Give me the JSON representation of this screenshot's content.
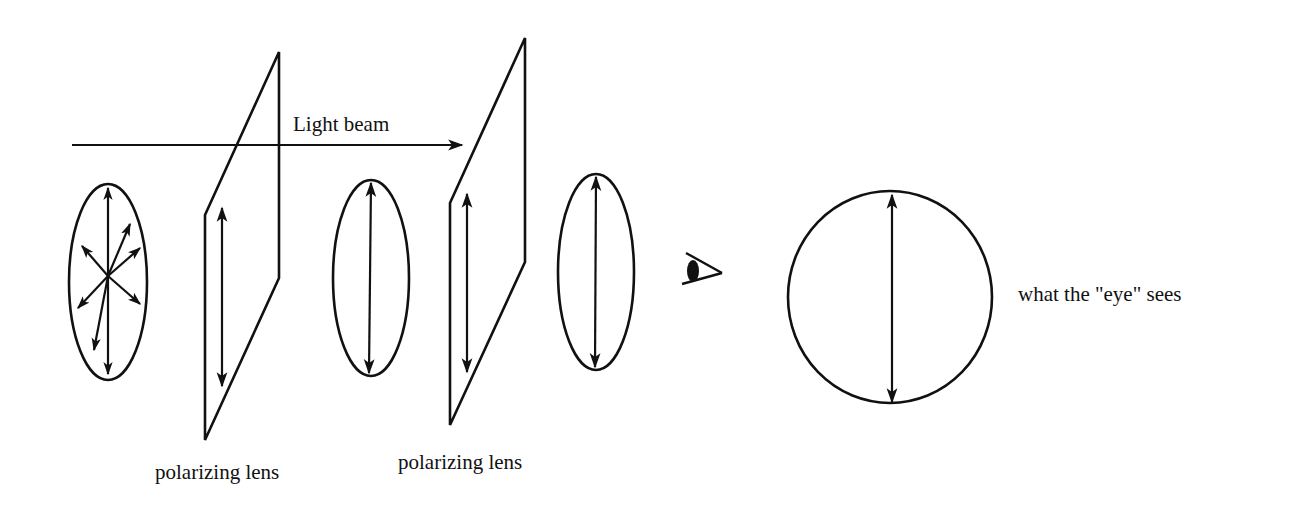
{
  "diagram": {
    "colors": {
      "ink": "#111111",
      "background": "#ffffff"
    },
    "labels": {
      "light_beam": "Light beam",
      "lens_1": "polarizing lens",
      "lens_2": "polarizing lens",
      "eye_sees": "what the \"eye\" sees"
    },
    "elements": [
      {
        "id": "unpolarized-light",
        "shape": "ellipse",
        "arrows": "multiple directions (unpolarized)"
      },
      {
        "id": "polarizer-1",
        "shape": "parallelogram",
        "arrows": "vertical"
      },
      {
        "id": "polarized-light-1",
        "shape": "ellipse",
        "arrows": "vertical"
      },
      {
        "id": "polarizer-2",
        "shape": "parallelogram",
        "arrows": "vertical"
      },
      {
        "id": "polarized-light-2",
        "shape": "ellipse",
        "arrows": "vertical"
      },
      {
        "id": "eye",
        "shape": "eye-icon"
      },
      {
        "id": "observed-view",
        "shape": "circle",
        "arrows": "vertical"
      }
    ]
  }
}
